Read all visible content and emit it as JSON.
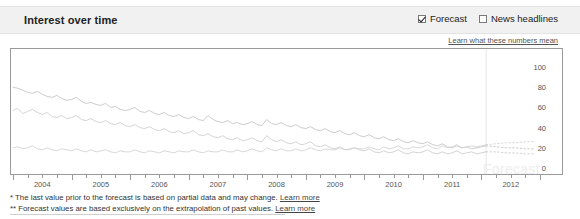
{
  "header": {
    "title": "Interest over time",
    "controls": [
      {
        "label": "Forecast",
        "checked": true,
        "name": "forecast-checkbox"
      },
      {
        "label": "News headlines",
        "checked": false,
        "name": "news-headlines-checkbox"
      }
    ],
    "learn_link": "Learn what these numbers mean"
  },
  "watermark": "Forecast",
  "footnotes": [
    {
      "marker": "*",
      "text": " The last value prior to the forecast is based on partial data and may change. ",
      "link": "Learn more"
    },
    {
      "marker": "**",
      "text": " Forecast values are based exclusively on the extrapolation of past values. ",
      "link": "Learn more"
    }
  ],
  "chart_data": {
    "type": "line",
    "title": "Interest over time",
    "xlabel": "",
    "ylabel": "",
    "ylim": [
      0,
      110
    ],
    "yticks": [
      0,
      20,
      40,
      60,
      80,
      100
    ],
    "grid": false,
    "legend": "none",
    "xlim": [
      2004.0,
      2013.0
    ],
    "xticks_major": [
      2004,
      2005,
      2006,
      2007,
      2008,
      2009,
      2010,
      2011,
      2012
    ],
    "xtick_labels": [
      "2004",
      "2005",
      "2006",
      "2007",
      "2008",
      "2009",
      "2010",
      "2011",
      "2012"
    ],
    "xticks_minor_per_year": 4,
    "forecast_start_x": 2012.08,
    "forecast_divider": true,
    "line_color": "#c8c8c8",
    "forecast_style": "dotted",
    "series": [
      {
        "name": "series-1",
        "color": "#c6c6c6",
        "x": [
          2004.0,
          2004.08,
          2004.17,
          2004.25,
          2004.33,
          2004.42,
          2004.5,
          2004.58,
          2004.67,
          2004.75,
          2004.83,
          2004.92,
          2005.0,
          2005.08,
          2005.17,
          2005.25,
          2005.33,
          2005.42,
          2005.5,
          2005.58,
          2005.67,
          2005.75,
          2005.83,
          2005.92,
          2006.0,
          2006.08,
          2006.17,
          2006.25,
          2006.33,
          2006.42,
          2006.5,
          2006.58,
          2006.67,
          2006.75,
          2006.83,
          2006.92,
          2007.0,
          2007.08,
          2007.17,
          2007.25,
          2007.33,
          2007.42,
          2007.5,
          2007.58,
          2007.67,
          2007.75,
          2007.83,
          2007.92,
          2008.0,
          2008.08,
          2008.17,
          2008.25,
          2008.33,
          2008.42,
          2008.5,
          2008.58,
          2008.67,
          2008.75,
          2008.83,
          2008.92,
          2009.0,
          2009.08,
          2009.17,
          2009.25,
          2009.33,
          2009.42,
          2009.5,
          2009.58,
          2009.67,
          2009.75,
          2009.83,
          2009.92,
          2010.0,
          2010.08,
          2010.17,
          2010.25,
          2010.33,
          2010.42,
          2010.5,
          2010.58,
          2010.67,
          2010.75,
          2010.83,
          2010.92,
          2011.0,
          2011.08,
          2011.17,
          2011.25,
          2011.33,
          2011.42,
          2011.5,
          2011.58,
          2011.67,
          2011.75,
          2011.83,
          2011.92,
          2012.0,
          2012.08
        ],
        "y": [
          80,
          79,
          77,
          75,
          74,
          76,
          73,
          71,
          70,
          72,
          69,
          67,
          68,
          70,
          66,
          64,
          65,
          63,
          62,
          64,
          60,
          61,
          58,
          57,
          58,
          60,
          56,
          55,
          57,
          54,
          53,
          55,
          52,
          51,
          53,
          50,
          49,
          51,
          48,
          47,
          52,
          48,
          46,
          45,
          47,
          44,
          45,
          43,
          44,
          46,
          43,
          42,
          48,
          44,
          43,
          45,
          42,
          41,
          43,
          40,
          39,
          41,
          38,
          37,
          39,
          36,
          35,
          37,
          34,
          33,
          35,
          32,
          31,
          33,
          30,
          29,
          31,
          28,
          27,
          29,
          26,
          25,
          27,
          25,
          24,
          26,
          23,
          22,
          24,
          21,
          20,
          22,
          20,
          21,
          19,
          20,
          21,
          22
        ],
        "forecast_x": [
          2012.08,
          2012.25,
          2012.42,
          2012.58,
          2012.75,
          2012.92
        ],
        "forecast_y": [
          22,
          21,
          20,
          20,
          19,
          19
        ]
      },
      {
        "name": "series-2",
        "color": "#cfcfcf",
        "x": [
          2004.0,
          2004.08,
          2004.17,
          2004.25,
          2004.33,
          2004.42,
          2004.5,
          2004.58,
          2004.67,
          2004.75,
          2004.83,
          2004.92,
          2005.0,
          2005.08,
          2005.17,
          2005.25,
          2005.33,
          2005.42,
          2005.5,
          2005.58,
          2005.67,
          2005.75,
          2005.83,
          2005.92,
          2006.0,
          2006.08,
          2006.17,
          2006.25,
          2006.33,
          2006.42,
          2006.5,
          2006.58,
          2006.67,
          2006.75,
          2006.83,
          2006.92,
          2007.0,
          2007.08,
          2007.17,
          2007.25,
          2007.33,
          2007.42,
          2007.5,
          2007.58,
          2007.67,
          2007.75,
          2007.83,
          2007.92,
          2008.0,
          2008.08,
          2008.17,
          2008.25,
          2008.33,
          2008.42,
          2008.5,
          2008.58,
          2008.67,
          2008.75,
          2008.83,
          2008.92,
          2009.0,
          2009.08,
          2009.17,
          2009.25,
          2009.33,
          2009.42,
          2009.5,
          2009.58,
          2009.67,
          2009.75,
          2009.83,
          2009.92,
          2010.0,
          2010.08,
          2010.17,
          2010.25,
          2010.33,
          2010.42,
          2010.5,
          2010.58,
          2010.67,
          2010.75,
          2010.83,
          2010.92,
          2011.0,
          2011.08,
          2011.17,
          2011.25,
          2011.33,
          2011.42,
          2011.5,
          2011.58,
          2011.67,
          2011.75,
          2011.83,
          2011.92,
          2012.0,
          2012.08
        ],
        "y": [
          57,
          59,
          54,
          56,
          58,
          55,
          53,
          55,
          51,
          50,
          52,
          49,
          50,
          52,
          48,
          47,
          49,
          46,
          45,
          47,
          44,
          43,
          45,
          42,
          41,
          43,
          40,
          39,
          41,
          38,
          37,
          39,
          36,
          35,
          37,
          34,
          35,
          37,
          33,
          32,
          34,
          31,
          30,
          32,
          29,
          28,
          30,
          27,
          28,
          30,
          27,
          26,
          32,
          28,
          26,
          28,
          25,
          24,
          26,
          23,
          24,
          26,
          22,
          21,
          23,
          20,
          19,
          21,
          18,
          19,
          20,
          18,
          17,
          19,
          16,
          15,
          17,
          15,
          16,
          18,
          15,
          14,
          16,
          15,
          16,
          18,
          15,
          14,
          16,
          14,
          15,
          17,
          14,
          15,
          16,
          14,
          15,
          16
        ],
        "forecast_x": [
          2012.08,
          2012.25,
          2012.42,
          2012.58,
          2012.75,
          2012.92
        ],
        "forecast_y": [
          16,
          16,
          15,
          15,
          14,
          14
        ]
      },
      {
        "name": "series-3",
        "color": "#d4d4d4",
        "x": [
          2004.0,
          2004.08,
          2004.17,
          2004.25,
          2004.33,
          2004.42,
          2004.5,
          2004.58,
          2004.67,
          2004.75,
          2004.83,
          2004.92,
          2005.0,
          2005.08,
          2005.17,
          2005.25,
          2005.33,
          2005.42,
          2005.5,
          2005.58,
          2005.67,
          2005.75,
          2005.83,
          2005.92,
          2006.0,
          2006.08,
          2006.17,
          2006.25,
          2006.33,
          2006.42,
          2006.5,
          2006.58,
          2006.67,
          2006.75,
          2006.83,
          2006.92,
          2007.0,
          2007.08,
          2007.17,
          2007.25,
          2007.33,
          2007.42,
          2007.5,
          2007.58,
          2007.67,
          2007.75,
          2007.83,
          2007.92,
          2008.0,
          2008.08,
          2008.17,
          2008.25,
          2008.33,
          2008.42,
          2008.5,
          2008.58,
          2008.67,
          2008.75,
          2008.83,
          2008.92,
          2009.0,
          2009.08,
          2009.17,
          2009.25,
          2009.33,
          2009.42,
          2009.5,
          2009.58,
          2009.67,
          2009.75,
          2009.83,
          2009.92,
          2010.0,
          2010.08,
          2010.17,
          2010.25,
          2010.33,
          2010.42,
          2010.5,
          2010.58,
          2010.67,
          2010.75,
          2010.83,
          2010.92,
          2011.0,
          2011.08,
          2011.17,
          2011.25,
          2011.33,
          2011.42,
          2011.5,
          2011.58,
          2011.67,
          2011.75,
          2011.83,
          2011.92,
          2012.0,
          2012.08
        ],
        "y": [
          20,
          21,
          19,
          20,
          22,
          19,
          18,
          20,
          18,
          17,
          19,
          18,
          17,
          19,
          17,
          16,
          18,
          16,
          17,
          18,
          16,
          15,
          17,
          16,
          16,
          18,
          16,
          15,
          17,
          16,
          15,
          17,
          16,
          15,
          17,
          16,
          16,
          18,
          16,
          15,
          17,
          16,
          16,
          18,
          16,
          16,
          18,
          16,
          17,
          19,
          17,
          16,
          20,
          18,
          17,
          19,
          17,
          17,
          19,
          17,
          18,
          20,
          18,
          17,
          19,
          18,
          18,
          20,
          18,
          18,
          20,
          19,
          19,
          21,
          19,
          18,
          21,
          19,
          20,
          22,
          19,
          19,
          21,
          20,
          21,
          23,
          20,
          19,
          22,
          20,
          21,
          23,
          20,
          21,
          22,
          21,
          22,
          23
        ],
        "forecast_x": [
          2012.08,
          2012.25,
          2012.42,
          2012.58,
          2012.75,
          2012.92
        ],
        "forecast_y": [
          23,
          24,
          25,
          25,
          26,
          26
        ]
      }
    ]
  }
}
